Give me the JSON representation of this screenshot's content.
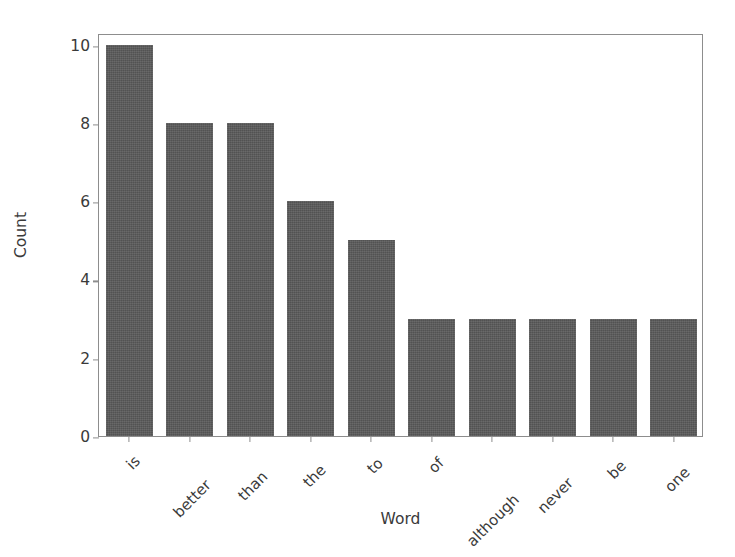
{
  "chart_data": {
    "type": "bar",
    "title": "",
    "xlabel": "Word",
    "ylabel": "Count",
    "categories": [
      "is",
      "better",
      "than",
      "the",
      "to",
      "of",
      "although",
      "never",
      "be",
      "one"
    ],
    "values": [
      10,
      8,
      8,
      6,
      5,
      3,
      3,
      3,
      3,
      3
    ],
    "series": [
      {
        "name": "Count",
        "values": [
          10,
          8,
          8,
          6,
          5,
          3,
          3,
          3,
          3,
          3
        ]
      }
    ],
    "ylim": [
      0,
      10.3
    ],
    "yticks": [
      0,
      2,
      4,
      6,
      8,
      10
    ],
    "ytick_labels": [
      "0",
      "2",
      "4",
      "6",
      "8",
      "10"
    ],
    "xtick_labels": [
      "is",
      "better",
      "than",
      "the",
      "to",
      "of",
      "although",
      "never",
      "be",
      "one"
    ],
    "xtick_rotation": -45,
    "grid": false,
    "legend": false,
    "legend_position": "none",
    "bar_color": "#5a5a5a",
    "axis_color": "#8d8d8d",
    "text_color": "#3a3a3a",
    "background_color": "#ffffff"
  }
}
